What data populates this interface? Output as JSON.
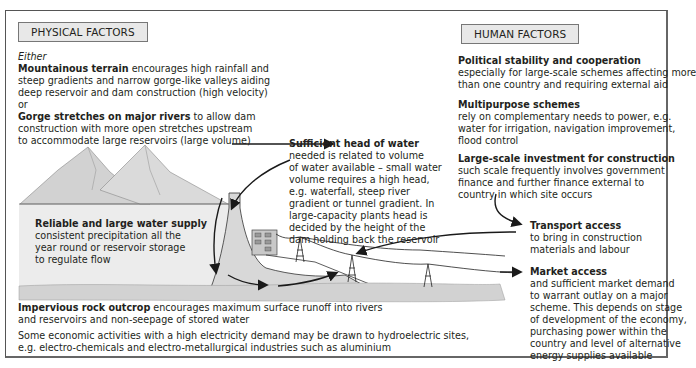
{
  "physical": {
    "header": "PHYSICAL FACTORS",
    "either": "Either",
    "mountain_title": "Mountainous terrain",
    "mountain_l1": " encourages high rainfall and",
    "mountain_l2": "steep gradients and narrow gorge-like valleys aiding",
    "mountain_l3": "deep reservoir and dam construction (high velocity)",
    "or": "or",
    "gorge_title": "Gorge stretches on major rivers",
    "gorge_l1": " to allow dam",
    "gorge_l2": "construction with more open stretches upstream",
    "gorge_l3": "to accommodate large reservoirs (large volume)",
    "head_title": "Sufficient head of water",
    "head_lines": [
      "needed is related to volume",
      "of water available – small water",
      "volume requires a high head,",
      "e.g. waterfall, steep river",
      "gradient or tunnel gradient. In",
      "large-capacity plants head is",
      "decided by the height of the",
      "dam holding back the reservoir"
    ],
    "supply_title": "Reliable and large water supply",
    "supply_lines": [
      "consistent precipitation all the",
      "year round or reservoir storage",
      "to regulate flow"
    ],
    "rock_title": "Impervious rock outcrop",
    "rock_l1": " encourages maximum surface runoff into rivers",
    "rock_l2": "and reservoirs and non-seepage of stored water",
    "econ_l1": "Some economic activities with a high electricity demand may be drawn to hydroelectric sites,",
    "econ_l2": "e.g. electro-chemicals and electro-metallurgical industries such as aluminium"
  },
  "human": {
    "header": "HUMAN FACTORS",
    "political_title": "Political stability and cooperation",
    "political_lines": [
      "especially for large-scale schemes affecting more",
      "than one country and requiring external aid"
    ],
    "multi_title": "Multipurpose schemes",
    "multi_lines": [
      "rely on complementary needs to power, e.g.",
      "water for irrigation, navigation improvement,",
      "flood control"
    ],
    "invest_title": "Large-scale investment for construction",
    "invest_lines": [
      "such scale frequently involves government",
      "finance and further finance external to",
      "country in which site occurs"
    ],
    "transport_title": "Transport access",
    "transport_lines": [
      "to bring in construction",
      "materials and labour"
    ],
    "market_title": "Market access",
    "market_lines": [
      "and sufficient market demand",
      "to warrant outlay on a major",
      "scheme. This depends on stage",
      "of development of the economy,",
      "purchasing power within the",
      "country and level of alternative",
      "energy supplies available"
    ]
  },
  "colors": {
    "header_bg": "#e8e8e8",
    "mountain": "#d6d6d6",
    "reservoir": "#ececec",
    "rock": "#d2d2d2",
    "arrow": "#1a1a1a"
  }
}
